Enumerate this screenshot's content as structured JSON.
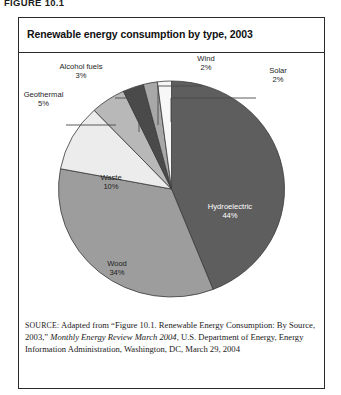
{
  "figure_label": "FIGURE 10.1",
  "chart": {
    "title": "Renewable energy consumption by type, 2003"
  },
  "source": {
    "prefix": "SOURCE:",
    "text_before_italic": " Adapted from “Figure 10.1. Renewable Energy Consumption: By Source, 2003,” ",
    "italic_title": "Monthly Energy Review March 2004",
    "text_after_italic": ", U.S. Department of Energy, Energy Information Administration, Washington, DC, March 29, 2004"
  },
  "chart_data": {
    "type": "pie",
    "title": "Renewable energy consumption by type, 2003",
    "xlabel": "",
    "ylabel": "",
    "legend": "none",
    "units": "percent",
    "categories": [
      "Hydroelectric",
      "Wood",
      "Waste",
      "Geothermal",
      "Alcohol fuels",
      "Wind",
      "Solar"
    ],
    "values": [
      44,
      34,
      10,
      5,
      3,
      2,
      2
    ],
    "slices": [
      {
        "label": "Hydroelectric",
        "pct": 44,
        "value_text": "44%",
        "color": "#5e5e5e",
        "label_placement": "inside",
        "label_color": "#ffffff"
      },
      {
        "label": "Wood",
        "pct": 34,
        "value_text": "34%",
        "color": "#9d9d9d",
        "label_placement": "inside",
        "label_color": "#1d1d1d"
      },
      {
        "label": "Waste",
        "pct": 10,
        "value_text": "10%",
        "color": "#ececec",
        "label_placement": "inside",
        "label_color": "#1d1d1d"
      },
      {
        "label": "Geothermal",
        "pct": 5,
        "value_text": "5%",
        "color": "#b8b8b8",
        "label_placement": "outside-left",
        "label_color": "#1d1d1d"
      },
      {
        "label": "Alcohol fuels",
        "pct": 3,
        "value_text": "3%",
        "color": "#4a4a4a",
        "label_placement": "outside-top-left",
        "label_color": "#1d1d1d"
      },
      {
        "label": "Wind",
        "pct": 2,
        "value_text": "2%",
        "color": "#a8a8a8",
        "label_placement": "outside-top",
        "label_color": "#1d1d1d"
      },
      {
        "label": "Solar",
        "pct": 2,
        "value_text": "2%",
        "color": "#f7f7f7",
        "label_placement": "outside-right",
        "label_color": "#1d1d1d"
      }
    ],
    "start_angle_deg": -90,
    "direction": "clockwise",
    "outline_color": "#3a3a3a"
  },
  "labels": {
    "hydroelectric": {
      "name": "Hydroelectric",
      "pct": "44%"
    },
    "wood": {
      "name": "Wood",
      "pct": "34%"
    },
    "waste": {
      "name": "Waste",
      "pct": "10%"
    },
    "geothermal": {
      "name": "Geothermal",
      "pct": "5%"
    },
    "alcohol": {
      "name": "Alcohol fuels",
      "pct": "3%"
    },
    "wind": {
      "name": "Wind",
      "pct": "2%"
    },
    "solar": {
      "name": "Solar",
      "pct": "2%"
    }
  }
}
